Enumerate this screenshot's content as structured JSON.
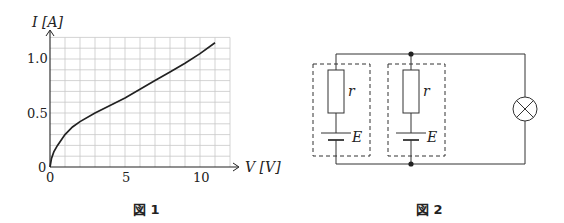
{
  "figure1": {
    "caption": "図 1",
    "y_axis_label": "I [A]",
    "x_axis_label": "V [V]",
    "y_ticks": [
      "0",
      "0.5",
      "1.0"
    ],
    "x_ticks": [
      "0",
      "5",
      "10"
    ]
  },
  "figure2": {
    "caption": "図 2",
    "resistor_label_1": "r",
    "resistor_label_2": "r",
    "battery_label_1": "E",
    "battery_label_2": "E"
  },
  "chart_data": {
    "type": "line",
    "title": "図 1",
    "xlabel": "V [V]",
    "ylabel": "I [A]",
    "xlim": [
      0,
      12
    ],
    "ylim": [
      0,
      1.2
    ],
    "grid": true,
    "x_tick_labels": [
      "0",
      "5",
      "10"
    ],
    "y_tick_labels": [
      "0",
      "0.5",
      "1.0"
    ],
    "series": [
      {
        "name": "I-V characteristic of lamp",
        "x": [
          0,
          0.1,
          0.25,
          0.5,
          1,
          1.5,
          2,
          3,
          4,
          5,
          6,
          7,
          8,
          9,
          10,
          11
        ],
        "y": [
          0,
          0.08,
          0.14,
          0.2,
          0.3,
          0.37,
          0.42,
          0.5,
          0.57,
          0.64,
          0.72,
          0.8,
          0.88,
          0.96,
          1.05,
          1.15
        ]
      }
    ]
  }
}
